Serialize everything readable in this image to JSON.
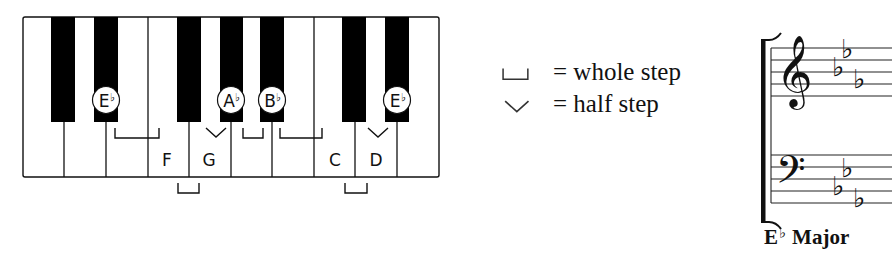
{
  "keyboard": {
    "x": 23,
    "y": 17,
    "width": 416,
    "height": 160,
    "white_key_count": 10,
    "white_dividers_x": [
      64,
      106,
      148,
      189,
      231,
      272,
      314,
      355,
      397
    ],
    "black_keys": [
      {
        "note": "C#/Db",
        "x": 51,
        "width": 24
      },
      {
        "note": "D#/Eb",
        "x": 94,
        "width": 24
      },
      {
        "note": "F#/Gb",
        "x": 177,
        "width": 24
      },
      {
        "note": "G#/Ab",
        "x": 220,
        "width": 23
      },
      {
        "note": "A#/Bb",
        "x": 260,
        "width": 24
      },
      {
        "note": "C#/Db",
        "x": 342,
        "width": 24
      },
      {
        "note": "D#/Eb",
        "x": 385,
        "width": 24
      }
    ],
    "black_key_height": 105,
    "circled_labels": [
      {
        "letter": "E",
        "accidental": "♭",
        "cx": 106,
        "cy": 100
      },
      {
        "letter": "A",
        "accidental": "♭",
        "cx": 231,
        "cy": 100
      },
      {
        "letter": "B",
        "accidental": "♭",
        "cx": 272,
        "cy": 100
      },
      {
        "letter": "E",
        "accidental": "♭",
        "cx": 397,
        "cy": 100
      }
    ],
    "white_labels": [
      {
        "text": "F",
        "x": 167,
        "y": 166
      },
      {
        "text": "G",
        "x": 209,
        "y": 166
      },
      {
        "text": "C",
        "x": 335,
        "y": 166
      },
      {
        "text": "D",
        "x": 376,
        "y": 166
      }
    ],
    "whole_steps_upper": [
      {
        "from": "E♭",
        "to": "F",
        "x1": 115,
        "x2": 159,
        "y1": 128,
        "y2": 138
      },
      {
        "from": "A♭",
        "to": "B♭",
        "x1": 243,
        "x2": 263,
        "y1": 128,
        "y2": 138
      },
      {
        "from": "B♭",
        "to": "C",
        "x1": 280,
        "x2": 322,
        "y1": 128,
        "y2": 138
      }
    ],
    "whole_steps_lower": [
      {
        "from": "F",
        "to": "G",
        "x1": 178,
        "x2": 199,
        "y1": 183,
        "y2": 193
      },
      {
        "from": "C",
        "to": "D",
        "x1": 345,
        "x2": 367,
        "y1": 183,
        "y2": 193
      }
    ],
    "half_steps": [
      {
        "from": "G",
        "to": "A♭",
        "x1": 206,
        "x2": 226,
        "y1": 128,
        "y2": 137
      },
      {
        "from": "D",
        "to": "E♭",
        "x1": 368,
        "x2": 388,
        "y1": 128,
        "y2": 137
      }
    ]
  },
  "legend": {
    "items": [
      {
        "icon": "whole-step-bracket-icon",
        "text": "= whole step"
      },
      {
        "icon": "half-step-chevron-icon",
        "text": "= half step"
      }
    ]
  },
  "staff": {
    "treble_clef": "𝄞",
    "bass_clef": "𝄢",
    "treble_lines_y": [
      48,
      60,
      72,
      84,
      96
    ],
    "bass_lines_y": [
      155,
      167,
      179,
      191,
      203
    ],
    "key_signature": [
      "B♭",
      "E♭",
      "A♭"
    ],
    "flat_glyph": "♭",
    "caption_letter": "E",
    "caption_accidental": "♭",
    "caption_word": "Major"
  },
  "colors": {
    "ink": "#111111",
    "key_black": "#000000",
    "key_white": "#ffffff",
    "background": "#ffffff"
  }
}
